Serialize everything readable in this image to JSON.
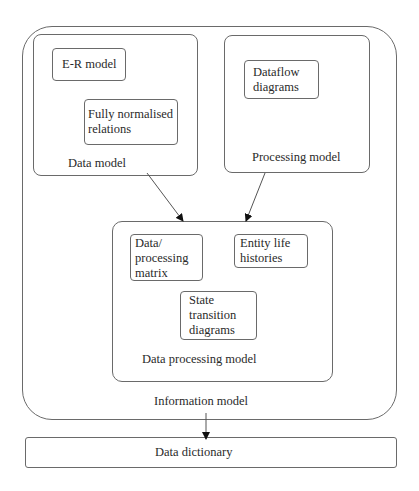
{
  "diagram": {
    "information_model": {
      "label": "Information model",
      "data_model": {
        "label": "Data model",
        "items": [
          "E-R model",
          "Fully normalised\nrelations"
        ]
      },
      "processing_model": {
        "label": "Processing model",
        "items": [
          "Dataflow\ndiagrams"
        ]
      },
      "data_processing_model": {
        "label": "Data processing model",
        "items": [
          "Data/\nprocessing\nmatrix",
          "Entity life\nhistories",
          "State\ntransition\ndiagrams"
        ]
      }
    },
    "data_dictionary": {
      "label": "Data dictionary"
    },
    "arrows": [
      {
        "from": "Data model",
        "to": "Data processing model"
      },
      {
        "from": "Processing model",
        "to": "Data processing model"
      },
      {
        "from": "Information model",
        "to": "Data dictionary"
      }
    ],
    "colors": {
      "line": "#6a6a6a",
      "text": "#2a2a2a",
      "arrowhead": "#111111"
    }
  }
}
